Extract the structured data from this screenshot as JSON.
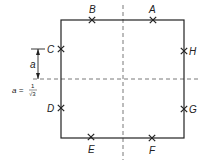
{
  "diagram": {
    "points": [
      {
        "id": "B",
        "label": "B",
        "side": "top"
      },
      {
        "id": "A",
        "label": "A",
        "side": "top"
      },
      {
        "id": "C",
        "label": "C",
        "side": "left"
      },
      {
        "id": "H",
        "label": "H",
        "side": "right"
      },
      {
        "id": "D",
        "label": "D",
        "side": "left"
      },
      {
        "id": "G",
        "label": "G",
        "side": "right"
      },
      {
        "id": "E",
        "label": "E",
        "side": "bottom"
      },
      {
        "id": "F",
        "label": "F",
        "side": "bottom"
      }
    ],
    "dimension_label": "a",
    "formula": {
      "lhs": "a =",
      "numerator": "1",
      "denominator": "√3"
    }
  }
}
